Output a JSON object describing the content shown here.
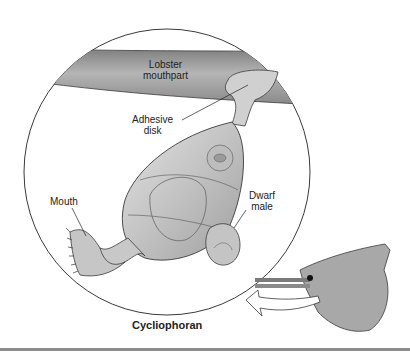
{
  "figure": {
    "caption": "Cycliophoran",
    "labels": {
      "lobster_mouthpart_line1": "Lobster",
      "lobster_mouthpart_line2": "mouthpart",
      "adhesive_disk_line1": "Adhesive",
      "adhesive_disk_line2": "disk",
      "mouth": "Mouth",
      "dwarf_male_line1": "Dwarf",
      "dwarf_male_line2": "male"
    },
    "colors": {
      "body_fill": "#c4c4c4",
      "mouthpart_fill": "#9a9a9a",
      "outline": "#3a3a3a",
      "rule": "#8c8c8c",
      "background": "#ffffff"
    }
  }
}
